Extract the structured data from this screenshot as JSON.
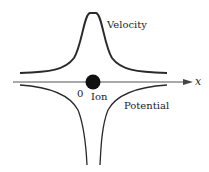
{
  "diagram": {
    "labels": {
      "velocity": "Velocity",
      "potential": "Potential",
      "ion": "Ion",
      "origin": "0",
      "x_axis": "x"
    },
    "colors": {
      "curve": "#2a2a2a",
      "axis": "#555555",
      "ion": "#111111",
      "background": "#ffffff"
    }
  }
}
